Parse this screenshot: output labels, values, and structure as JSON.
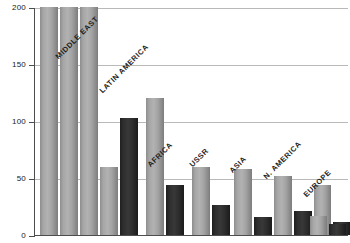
{
  "chart_data": {
    "type": "bar",
    "title": "",
    "subtitle": "",
    "xlabel": "",
    "ylabel": "",
    "ylim": [
      0,
      200
    ],
    "yticks": [
      0,
      50,
      100,
      150,
      200
    ],
    "ytick_labels": [
      "0",
      "50",
      "100",
      "150",
      "200"
    ],
    "grid": true,
    "legend": "none",
    "note": "Three leftmost bars are clipped at the top of the axis (values at or above 200).",
    "categories": [
      "",
      "",
      "",
      "MIDDLE EAST",
      "LATIN AMERICA",
      "AFRICA",
      "USSR",
      "ASIA",
      "N. AMERICA",
      "EUROPE"
    ],
    "series": [
      {
        "name": "light",
        "color": "#a8a8a8",
        "values": [
          200,
          200,
          200,
          60,
          120,
          60,
          58,
          52,
          44,
          17
        ]
      },
      {
        "name": "dark",
        "color": "#2b2b2b",
        "values": [
          null,
          null,
          null,
          103,
          44,
          26,
          16,
          21,
          11,
          10
        ]
      }
    ],
    "bars": [
      {
        "label": "",
        "value": 200,
        "shade": "light",
        "clipped": true,
        "x": 6,
        "width": 18
      },
      {
        "label": "",
        "value": 200,
        "shade": "light",
        "clipped": true,
        "x": 26,
        "width": 18
      },
      {
        "label": "",
        "value": 200,
        "shade": "light",
        "clipped": true,
        "x": 46,
        "width": 18
      },
      {
        "label": "",
        "value": 60,
        "shade": "light",
        "clipped": false,
        "x": 66,
        "width": 18
      },
      {
        "label": "MIDDLE EAST",
        "value": 103,
        "shade": "dark",
        "clipped": false,
        "x": 86,
        "width": 18
      },
      {
        "label": "",
        "value": 120,
        "shade": "light",
        "clipped": false,
        "x": 112,
        "width": 18
      },
      {
        "label": "LATIN AMERICA",
        "value": 44,
        "shade": "dark",
        "clipped": false,
        "x": 132,
        "width": 18
      },
      {
        "label": "",
        "value": 60,
        "shade": "light",
        "clipped": false,
        "x": 158,
        "width": 18
      },
      {
        "label": "AFRICA",
        "value": 26,
        "shade": "dark",
        "clipped": false,
        "x": 178,
        "width": 18
      },
      {
        "label": "",
        "value": 58,
        "shade": "light",
        "clipped": false,
        "x": 200,
        "width": 18
      },
      {
        "label": "USSR",
        "value": 16,
        "shade": "dark",
        "clipped": false,
        "x": 220,
        "width": 18
      },
      {
        "label": "",
        "value": 52,
        "shade": "light",
        "clipped": false,
        "x": 240,
        "width": 18
      },
      {
        "label": "ASIA",
        "value": 21,
        "shade": "dark",
        "clipped": false,
        "x": 260,
        "width": 18
      },
      {
        "label": "",
        "value": 44,
        "shade": "light",
        "clipped": false,
        "x": 280,
        "width": 17
      },
      {
        "label": "N. AMERICA",
        "value": 11,
        "shade": "dark",
        "clipped": false,
        "x": 299,
        "width": 17
      },
      {
        "label": "",
        "value": 17,
        "shade": "light",
        "clipped": false,
        "x": 276,
        "width": 17
      },
      {
        "label": "EUROPE",
        "value": 10,
        "shade": "dark",
        "clipped": false,
        "x": 295,
        "width": 17
      }
    ],
    "category_labels": [
      {
        "text": "MIDDLE EAST",
        "x": 60,
        "y": 52
      },
      {
        "text": "LATIN AMERICA",
        "x": 104,
        "y": 86
      },
      {
        "text": "AFRICA",
        "x": 152,
        "y": 160
      },
      {
        "text": "USSR",
        "x": 194,
        "y": 160
      },
      {
        "text": "ASIA",
        "x": 234,
        "y": 166
      },
      {
        "text": "N. AMERICA",
        "x": 268,
        "y": 172
      },
      {
        "text": "EUROPE",
        "x": 308,
        "y": 190
      }
    ]
  },
  "colors": {
    "light_bar": "#a8a8a8",
    "dark_bar": "#2b2b2b",
    "gridline": "#b9b9b9",
    "axis": "#4d4d4d",
    "text": "#1a1a1a",
    "background": "#ffffff"
  }
}
